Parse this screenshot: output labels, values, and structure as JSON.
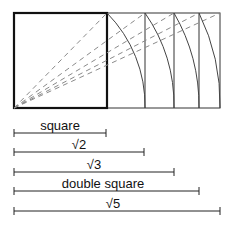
{
  "diagram": {
    "origin": {
      "x": 14,
      "y": 108
    },
    "square": {
      "x": 14,
      "y": 13,
      "size": 93
    },
    "verticals_x": [
      107,
      145,
      174,
      199,
      220
    ],
    "top_y": 13,
    "bottom_y": 108,
    "colors": {
      "stroke": "#222222",
      "dash": "#888888",
      "arc": "#444444"
    }
  },
  "measures": [
    {
      "label": "square",
      "x1": 14,
      "x2": 106,
      "y": 133
    },
    {
      "label": "√2",
      "x1": 14,
      "x2": 144,
      "y": 152
    },
    {
      "label": "√3",
      "x1": 14,
      "x2": 174,
      "y": 172
    },
    {
      "label": "double square",
      "x1": 14,
      "x2": 199,
      "y": 191
    },
    {
      "label": "√5",
      "x1": 14,
      "x2": 220,
      "y": 211
    }
  ]
}
